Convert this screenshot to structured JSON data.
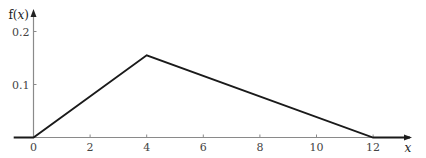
{
  "chart_data": {
    "type": "line",
    "title": "",
    "xlabel": "x",
    "ylabel": "f(x)",
    "ylabel_parts": {
      "f": "f(",
      "x": "x",
      "close": ")"
    },
    "x_ticks": [
      0,
      2,
      4,
      6,
      8,
      10,
      12
    ],
    "x_tick_labels": [
      "0",
      "2",
      "4",
      "6",
      "8",
      "10",
      "12"
    ],
    "y_ticks": [
      0.1,
      0.2
    ],
    "y_tick_labels": [
      "0.1",
      "0.2"
    ],
    "xlim": [
      -0.7,
      13.5
    ],
    "ylim": [
      0,
      0.24
    ],
    "grid": false,
    "legend": null,
    "series": [
      {
        "name": "f(x)",
        "x": [
          -0.7,
          0,
          4,
          12,
          13.3
        ],
        "y": [
          0,
          0,
          0.155,
          0,
          0
        ]
      }
    ],
    "colors": {
      "line": "#1a1a1a",
      "axis": "#8a8a8a",
      "text": "#333333"
    }
  }
}
